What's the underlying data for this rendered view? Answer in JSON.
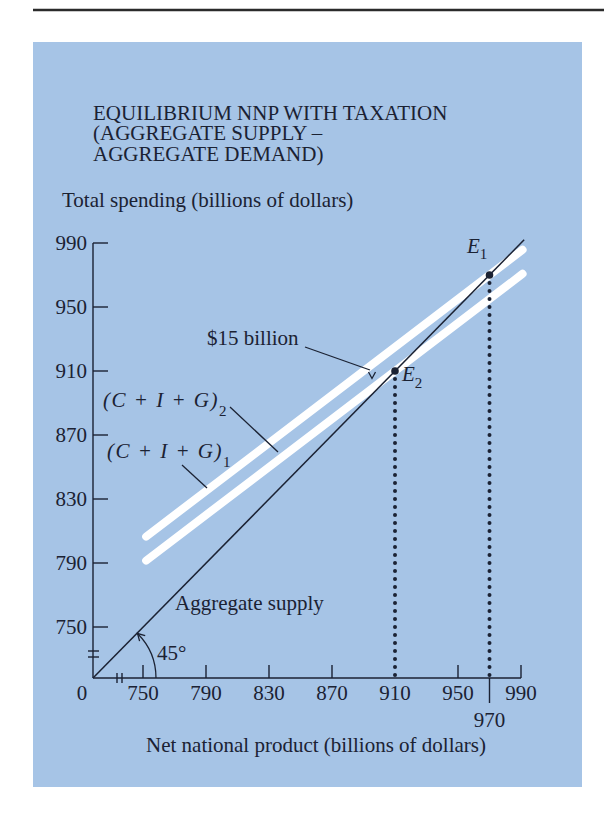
{
  "chart_data": {
    "type": "line",
    "title": "EQUILIBRIUM NNP WITH TAXATION (AGGREGATE SUPPLY – AGGREGATE DEMAND)",
    "title_lines": [
      "EQUILIBRIUM NNP WITH TAXATION",
      "(AGGREGATE SUPPLY –",
      "AGGREGATE DEMAND)"
    ],
    "xlabel": "Net national product (billions of dollars)",
    "ylabel": "Total spending (billions of dollars)",
    "origin_label": "0",
    "xlim": [
      750,
      990
    ],
    "ylim": [
      750,
      990
    ],
    "axis_break": true,
    "grid": false,
    "x_ticks": [
      750,
      790,
      830,
      870,
      910,
      950,
      990
    ],
    "x_tick_marks": [
      750,
      790,
      830,
      870,
      950,
      990
    ],
    "x_extra_tick": {
      "value": 970,
      "label": "970"
    },
    "y_ticks": [
      750,
      790,
      830,
      870,
      910,
      950,
      990
    ],
    "series": [
      {
        "name": "Aggregate supply",
        "label": "Aggregate supply",
        "style": "line-45-degree",
        "slope": 1,
        "points": [
          [
            0,
            0
          ],
          [
            992,
            992
          ]
        ]
      },
      {
        "name": "(C + I + G)1",
        "label_main": "(C + I + G)",
        "label_sub": "1",
        "style": "white-band",
        "slope": 0.75,
        "points": [
          [
            752,
            806.5
          ],
          [
            991,
            985.75
          ]
        ]
      },
      {
        "name": "(C + I + G)2",
        "label_main": "(C + I + G)",
        "label_sub": "2",
        "style": "white-band",
        "slope": 0.75,
        "points": [
          [
            752,
            791.5
          ],
          [
            991,
            970.75
          ]
        ]
      }
    ],
    "equilibria": [
      {
        "label": "E",
        "sub": "1",
        "x": 970,
        "y": 970
      },
      {
        "label": "E",
        "sub": "2",
        "x": 910,
        "y": 910
      }
    ],
    "annotations": {
      "tax_gap": "$15 billion",
      "angle": "45°"
    },
    "colors": {
      "background": "#a6c4e6",
      "bands": "#ffffff",
      "ink": "#1b2233",
      "rule": "#2b2b2b"
    }
  }
}
